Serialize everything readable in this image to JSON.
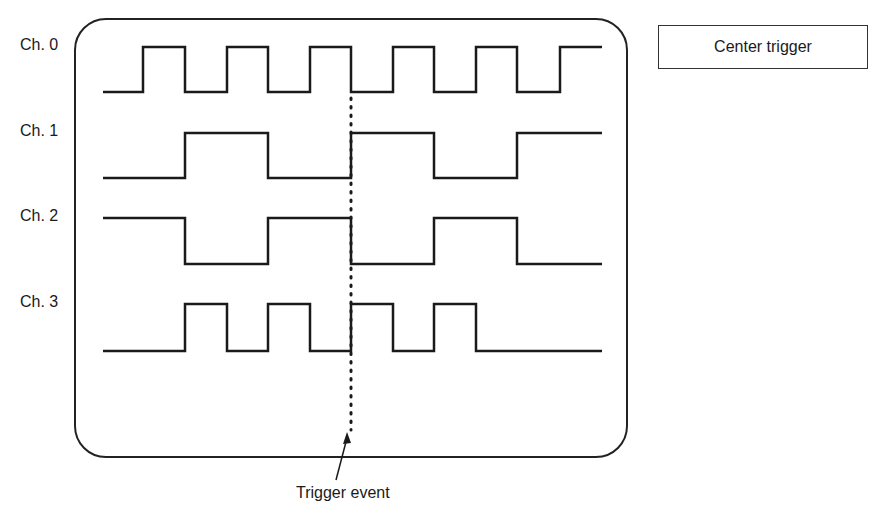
{
  "mode": {
    "label": "Center trigger"
  },
  "trigger": {
    "label": "Trigger event",
    "x": 351
  },
  "channels": [
    {
      "label": "Ch. 0",
      "high": 47,
      "low": 92
    },
    {
      "label": "Ch. 1",
      "high": 133,
      "low": 178
    },
    {
      "label": "Ch. 2",
      "high": 218,
      "low": 264
    },
    {
      "label": "Ch. 3",
      "high": 304,
      "low": 351
    }
  ],
  "timing": {
    "x_start": 103,
    "x_end": 602,
    "transitions": [
      143,
      185,
      227,
      268,
      310,
      351,
      393,
      434,
      476,
      517,
      560
    ],
    "states": {
      "ch0": [
        0,
        1,
        0,
        1,
        0,
        1,
        0,
        1,
        0,
        1,
        0,
        1
      ],
      "ch1": [
        0,
        0,
        1,
        1,
        0,
        0,
        1,
        1,
        0,
        0,
        1,
        1
      ],
      "ch2": [
        1,
        1,
        0,
        0,
        1,
        1,
        0,
        0,
        1,
        1,
        0,
        0
      ],
      "ch3": [
        0,
        0,
        1,
        0,
        1,
        0,
        1,
        0,
        1,
        0,
        0,
        0
      ]
    }
  }
}
